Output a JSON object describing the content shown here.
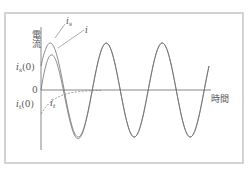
{
  "figure": {
    "y_axis_label": "電流",
    "x_axis_label": "時間",
    "origin_label": "0",
    "labels": {
      "i_s": {
        "base": "i",
        "sub": "s"
      },
      "i": {
        "base": "i"
      },
      "i_t": {
        "base": "i",
        "sub": "t"
      },
      "i_s0": {
        "base": "i",
        "sub": "s",
        "suffix": "(0)"
      },
      "i_t0": {
        "base": "i",
        "sub": "t",
        "suffix": "(0)"
      }
    },
    "colors": {
      "frame": "#c8c8c8",
      "curve": "#6d6d6d",
      "axis": "#6a6a6a",
      "text": "#555555"
    }
  },
  "chart_data": {
    "type": "line",
    "title": "",
    "xlabel": "時間",
    "ylabel": "電流",
    "series": [
      {
        "name": "i_s",
        "description": "steady-state sinusoidal current, starts at i_s(0) > 0",
        "style": "solid"
      },
      {
        "name": "i",
        "description": "total current i = i_s + i_t, starts at 0",
        "style": "solid"
      },
      {
        "name": "i_t",
        "description": "transient exponentially decaying current, starts at i_t(0) = -i_s(0)",
        "style": "dashed"
      }
    ],
    "annotations": [
      "i_s(0)",
      "i_t(0)",
      "0"
    ],
    "grid": false
  }
}
